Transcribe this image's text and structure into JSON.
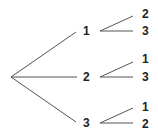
{
  "diagram": {
    "type": "tree",
    "root": {
      "x": 11,
      "y": 77
    },
    "level1": [
      {
        "label": "1",
        "x": 86,
        "y": 31,
        "edge_end": [
          76,
          32
        ],
        "children": [
          {
            "label": "2",
            "x": 146,
            "y": 14,
            "edge_end": [
              133,
              16
            ]
          },
          {
            "label": "3",
            "x": 146,
            "y": 31,
            "edge_end": [
              133,
              31
            ]
          }
        ]
      },
      {
        "label": "2",
        "x": 86,
        "y": 77,
        "edge_end": [
          77,
          77
        ],
        "children": [
          {
            "label": "1",
            "x": 146,
            "y": 59,
            "edge_end": [
              133,
              62
            ]
          },
          {
            "label": "3",
            "x": 146,
            "y": 77,
            "edge_end": [
              133,
              77
            ]
          }
        ]
      },
      {
        "label": "3",
        "x": 86,
        "y": 123,
        "edge_end": [
          76,
          122
        ],
        "children": [
          {
            "label": "1",
            "x": 146,
            "y": 107,
            "edge_end": [
              133,
              108
            ]
          },
          {
            "label": "2",
            "x": 146,
            "y": 124,
            "edge_end": [
              133,
              123
            ]
          }
        ]
      }
    ]
  }
}
